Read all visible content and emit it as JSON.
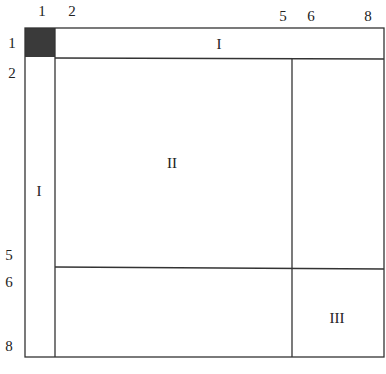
{
  "diagram": {
    "type": "partitioned-matrix",
    "column_labels": [
      {
        "text": "1",
        "x": 42
      },
      {
        "text": "2",
        "x": 72
      },
      {
        "text": "5",
        "x": 283
      },
      {
        "text": "6",
        "x": 311
      },
      {
        "text": "8",
        "x": 368
      }
    ],
    "row_labels": [
      {
        "text": "1",
        "y": 47
      },
      {
        "text": "2",
        "y": 77
      },
      {
        "text": "5",
        "y": 259
      },
      {
        "text": "6",
        "y": 286
      },
      {
        "text": "8",
        "y": 350
      }
    ],
    "regions": [
      {
        "label": "I",
        "name": "top-row-block",
        "x": 219,
        "y": 48
      },
      {
        "label": "I",
        "name": "left-column-block",
        "x": 39,
        "y": 194
      },
      {
        "label": "II",
        "name": "center-block",
        "x": 172,
        "y": 167
      },
      {
        "label": "III",
        "name": "bottom-right-block",
        "x": 337,
        "y": 322
      }
    ],
    "shaded_cell": {
      "row": "1",
      "col": "1",
      "color": "#3a3a3a"
    },
    "line_color": "#333333"
  }
}
